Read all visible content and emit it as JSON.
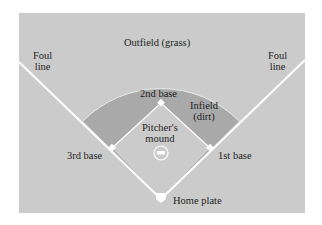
{
  "colors": {
    "page_background": "#ffffff",
    "outfield_grass": "#cbcbcb",
    "infield_dirt": "#a9a9a9",
    "infield_grass": "#cbcbcb",
    "lines": "#ffffff",
    "text": "#1e1e1e"
  },
  "labels": {
    "outfield": "Outfield (grass)",
    "foul_line_left": [
      "Foul",
      "line"
    ],
    "foul_line_right": [
      "Foul",
      "line"
    ],
    "second_base": "2nd base",
    "infield": [
      "Infield",
      "(dirt)"
    ],
    "pitchers_mound": [
      "Pitcher's",
      "mound"
    ],
    "third_base": "3rd base",
    "first_base": "1st base",
    "home_plate": "Home plate"
  }
}
